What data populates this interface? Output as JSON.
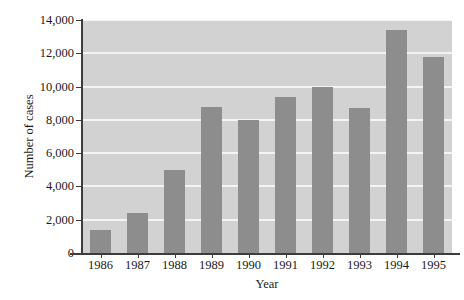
{
  "chart_data": {
    "type": "bar",
    "title": "",
    "subtitle": "",
    "xlabel": "Year",
    "ylabel": "Number of cases",
    "categories": [
      "1986",
      "1987",
      "1988",
      "1989",
      "1990",
      "1991",
      "1992",
      "1993",
      "1994",
      "1995"
    ],
    "values": [
      1400,
      2400,
      5000,
      8800,
      8000,
      9400,
      10000,
      8700,
      13400,
      11800
    ],
    "series": [
      {
        "name": "Number of cases",
        "values": [
          1400,
          2400,
          5000,
          8800,
          8000,
          9400,
          10000,
          8700,
          13400,
          11800
        ]
      }
    ],
    "ylim": [
      0,
      14000
    ],
    "ytick_values": [
      0,
      2000,
      4000,
      6000,
      8000,
      10000,
      12000,
      14000
    ],
    "ytick_labels": [
      "0",
      "2,000",
      "4,000",
      "6,000",
      "8,000",
      "10,000",
      "12,000",
      "14,000"
    ],
    "grid": true,
    "gridlines": "horizontal",
    "legend": "none",
    "bar_color": "#8d8d8d",
    "plot_background_color": "#d2d2d2",
    "gridline_color": "#f4f4f4",
    "axis_color": "#3c3c3c",
    "annotations": []
  }
}
